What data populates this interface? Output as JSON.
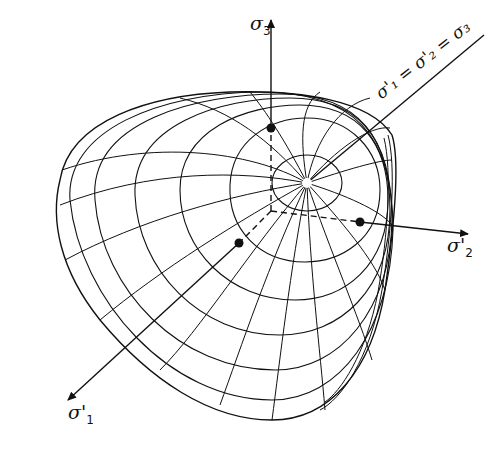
{
  "figure": {
    "axes": {
      "sigma3": {
        "symbol": "σ",
        "sub": "3"
      },
      "sigma2": {
        "symbol": "σ'",
        "sub": "2"
      },
      "sigma1": {
        "symbol": "σ'",
        "sub": "1"
      }
    },
    "hydrostatic_axis_label": "σ'₁ = σ'₂ = σ₃",
    "colors": {
      "ink": "#111111",
      "background": "#ffffff"
    }
  }
}
